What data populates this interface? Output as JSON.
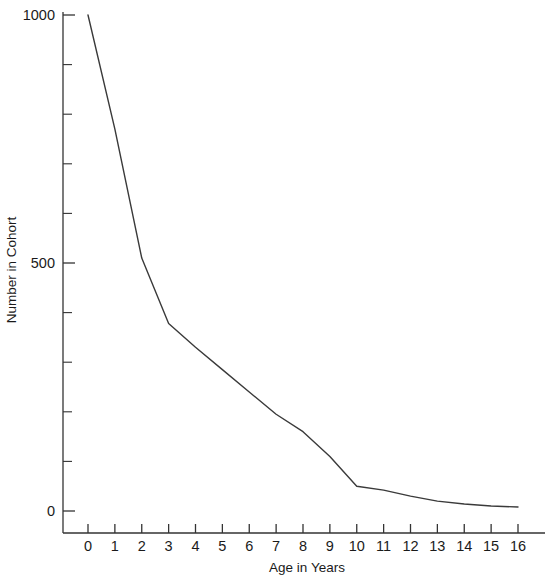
{
  "chart_data": {
    "type": "line",
    "title": "",
    "subtitle": "",
    "xlabel": "Age in Years",
    "ylabel": "Number in Cohort",
    "x": [
      0,
      1,
      2,
      3,
      4,
      5,
      6,
      7,
      8,
      9,
      10,
      11,
      12,
      13,
      14,
      15,
      16
    ],
    "values": [
      1000,
      770,
      510,
      378,
      330,
      285,
      240,
      195,
      160,
      110,
      50,
      42,
      30,
      20,
      14,
      10,
      8
    ],
    "series": [
      {
        "name": "Cohort survivors",
        "values": [
          1000,
          770,
          510,
          378,
          330,
          285,
          240,
          195,
          160,
          110,
          50,
          42,
          30,
          20,
          14,
          10,
          8
        ]
      }
    ],
    "xlim": [
      0,
      16
    ],
    "ylim": [
      0,
      1000
    ],
    "x_ticks": [
      0,
      1,
      2,
      3,
      4,
      5,
      6,
      7,
      8,
      9,
      10,
      11,
      12,
      13,
      14,
      15,
      16
    ],
    "x_tick_labels": [
      "0",
      "1",
      "2",
      "3",
      "4",
      "5",
      "6",
      "7",
      "8",
      "9",
      "10",
      "11",
      "12",
      "13",
      "14",
      "15",
      "16"
    ],
    "y_ticks_major": [
      0,
      500,
      1000
    ],
    "y_tick_labels_major": [
      "0",
      "500",
      "1000"
    ],
    "y_ticks_minor": [
      100,
      200,
      300,
      400,
      600,
      700,
      800,
      900
    ],
    "grid": false,
    "legend": false,
    "legend_position": "none",
    "line_color": "#3a3a3a",
    "axis_color": "#333333",
    "background_color": "#ffffff",
    "annotations": []
  }
}
